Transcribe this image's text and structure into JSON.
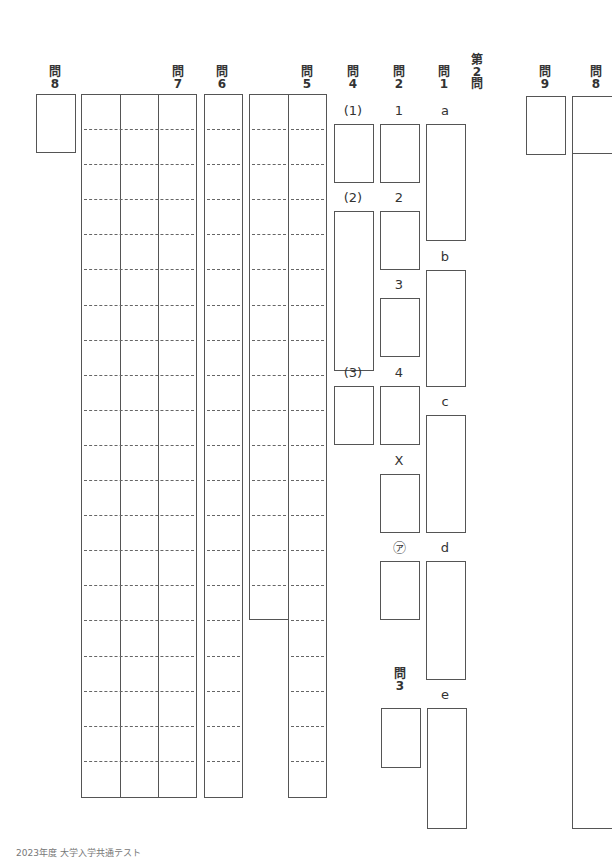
{
  "headers": {
    "q8_left": {
      "kanji": "問",
      "num": "8"
    },
    "q7": {
      "kanji": "問",
      "num": "7"
    },
    "q6": {
      "kanji": "問",
      "num": "6"
    },
    "q5": {
      "kanji": "問",
      "num": "5"
    },
    "q4": {
      "kanji": "問",
      "num": "4"
    },
    "q2": {
      "kanji": "問",
      "num": "2"
    },
    "q1": {
      "kanji": "問",
      "num": "1"
    },
    "section": {
      "line1": "第",
      "line2": "2",
      "line3": "問"
    },
    "q9": {
      "kanji": "問",
      "num": "9"
    },
    "q8_right": {
      "kanji": "問",
      "num": "8"
    },
    "q3": {
      "kanji": "問",
      "num": "3"
    }
  },
  "q4_labels": [
    "(1)",
    "(2)",
    "(3)"
  ],
  "q2_labels": [
    "1",
    "2",
    "3",
    "4",
    "X",
    "㋐"
  ],
  "q1_labels": [
    "a",
    "b",
    "c",
    "d",
    "e"
  ],
  "footer": "2023年度 大学入学共通テスト"
}
